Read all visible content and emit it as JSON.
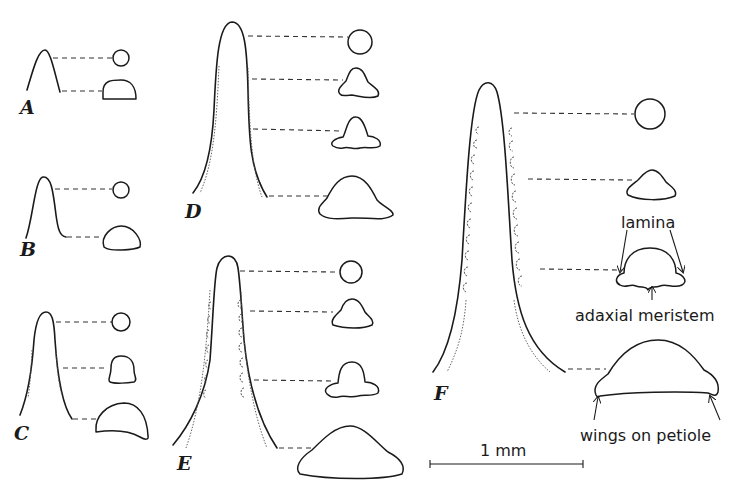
{
  "figure": {
    "panels": [
      {
        "id": "A",
        "label": "A",
        "sections": 2
      },
      {
        "id": "B",
        "label": "B",
        "sections": 2
      },
      {
        "id": "C",
        "label": "C",
        "sections": 3
      },
      {
        "id": "D",
        "label": "D",
        "sections": 4
      },
      {
        "id": "E",
        "label": "E",
        "sections": 4
      },
      {
        "id": "F",
        "label": "F",
        "sections": 4
      }
    ],
    "annotations": {
      "lamina": "lamina",
      "adaxial_meristem": "adaxial meristem",
      "wings_on_petiole": "wings on petiole"
    },
    "scale_bar": {
      "label": "1 mm",
      "length_mm": 1
    }
  }
}
